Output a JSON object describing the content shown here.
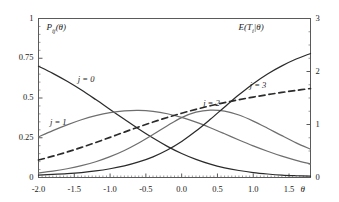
{
  "chart_data": {
    "type": "line",
    "title": "",
    "xlabel": "θ",
    "ylabel": "P_ij(θ)",
    "ylabel_right": "E(T_i|θ)",
    "xlim": [
      -2.0,
      1.8
    ],
    "ylim": [
      0,
      1
    ],
    "ylim_right": [
      0,
      3
    ],
    "grid": false,
    "legend_position": "inline-annotations",
    "x_ticks": [
      "-2.0",
      "-1.5",
      "-1.0",
      "-0.5",
      "0.0",
      "0.5",
      "1.0",
      "1.5"
    ],
    "x_tick_values": [
      -2.0,
      -1.5,
      -1.0,
      -0.5,
      0.0,
      0.5,
      1.0,
      1.5
    ],
    "y_ticks_left": [
      "0",
      "0.25",
      "0.5",
      "0.75",
      "1"
    ],
    "y_tick_values_left": [
      0,
      0.25,
      0.5,
      0.75,
      1
    ],
    "y_ticks_right": [
      "0",
      "1",
      "2",
      "3"
    ],
    "y_tick_values_right": [
      0,
      1,
      2,
      3
    ],
    "x": [
      -2.0,
      -1.8,
      -1.6,
      -1.4,
      -1.2,
      -1.0,
      -0.8,
      -0.6,
      -0.4,
      -0.2,
      0.0,
      0.2,
      0.4,
      0.6,
      0.8,
      1.0,
      1.2,
      1.4,
      1.6,
      1.8
    ],
    "series": [
      {
        "name": "j = 0",
        "style": "solid",
        "axis": "left",
        "color": "#2b2b2b",
        "label_x": -1.45,
        "label_y": 0.615,
        "values": [
          0.7,
          0.655,
          0.605,
          0.55,
          0.49,
          0.428,
          0.366,
          0.305,
          0.248,
          0.196,
          0.151,
          0.114,
          0.084,
          0.061,
          0.044,
          0.031,
          0.022,
          0.015,
          0.011,
          0.008
        ]
      },
      {
        "name": "j = 1",
        "style": "solid",
        "axis": "left",
        "color": "#6e6e6e",
        "label_x": -1.84,
        "label_y": 0.345,
        "values": [
          0.256,
          0.295,
          0.331,
          0.363,
          0.389,
          0.408,
          0.419,
          0.422,
          0.416,
          0.401,
          0.378,
          0.348,
          0.313,
          0.275,
          0.236,
          0.199,
          0.165,
          0.134,
          0.108,
          0.086
        ]
      },
      {
        "name": "j = 2",
        "style": "solid",
        "axis": "left",
        "color": "#6e6e6e",
        "label_x": 0.3,
        "label_y": 0.465,
        "values": [
          0.029,
          0.04,
          0.055,
          0.074,
          0.099,
          0.131,
          0.17,
          0.217,
          0.27,
          0.326,
          0.377,
          0.411,
          0.424,
          0.418,
          0.393,
          0.355,
          0.31,
          0.263,
          0.218,
          0.178
        ]
      },
      {
        "name": "j = 3",
        "style": "solid",
        "axis": "left",
        "color": "#2b2b2b",
        "label_x": 0.95,
        "label_y": 0.575,
        "values": [
          0.015,
          0.019,
          0.024,
          0.031,
          0.041,
          0.055,
          0.073,
          0.098,
          0.13,
          0.173,
          0.227,
          0.292,
          0.366,
          0.444,
          0.52,
          0.59,
          0.651,
          0.702,
          0.745,
          0.78
        ]
      },
      {
        "name": "E(T_i|θ)",
        "style": "dashed",
        "axis": "right",
        "color": "#2b2b2b",
        "label_x": 1.06,
        "label_y": 2.93,
        "values": [
          0.33,
          0.402,
          0.481,
          0.568,
          0.661,
          0.758,
          0.857,
          0.954,
          1.046,
          1.133,
          1.213,
          1.286,
          1.353,
          1.413,
          1.468,
          1.518,
          1.563,
          1.605,
          1.644,
          1.679
        ]
      }
    ]
  },
  "labels": {
    "y_axis_left_title": "P",
    "y_axis_left_sub": "ij",
    "y_axis_left_arg": "(θ)",
    "y_axis_right_title": "E(T",
    "y_axis_right_sub": "i",
    "y_axis_right_arg": "|θ)",
    "x_axis_title": "θ",
    "curve_j0": "j = 0",
    "curve_j1": "j = 1",
    "curve_j2": "j = 2",
    "curve_j3": "j = 3"
  },
  "colors": {
    "frame": "#5a5a5a",
    "dark_curve": "#2b2b2b",
    "light_curve": "#6e6e6e",
    "text": "#1a1a1a",
    "background": "#ffffff"
  }
}
